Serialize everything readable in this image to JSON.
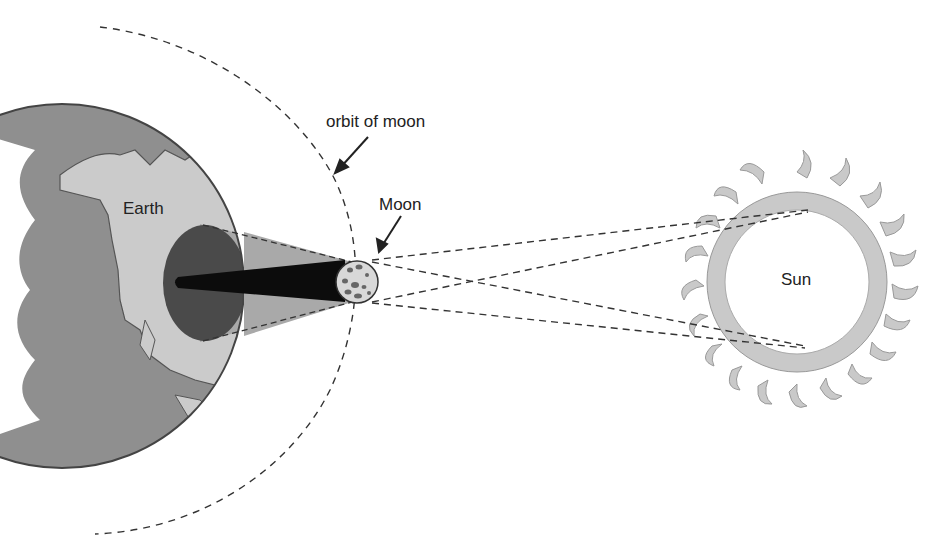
{
  "diagram": {
    "type": "solar-eclipse",
    "labels": {
      "orbit": "orbit of moon",
      "moon": "Moon",
      "earth": "Earth",
      "sun": "Sun"
    },
    "colors": {
      "ocean": "#8f8f8f",
      "land": "#c8c8c8",
      "penumbra_shadow": "#4a4a4a",
      "umbra": "#0c0c0c",
      "cone": "#a9a9a9",
      "corona": "#c9c9c9",
      "sun_disc": "#ffffff",
      "lines": "#333333"
    }
  }
}
